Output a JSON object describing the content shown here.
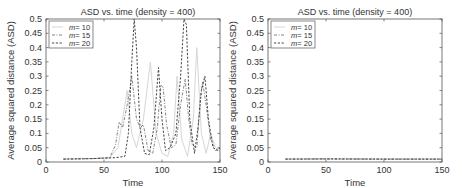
{
  "chart_data": [
    {
      "type": "line",
      "title": "ASD vs. time (density = 400)",
      "xlabel": "Time",
      "ylabel": "Average squared distance (ASD)",
      "xlim": [
        0,
        150
      ],
      "ylim": [
        0,
        0.5
      ],
      "xticks": [
        0,
        50,
        100,
        150
      ],
      "yticks": [
        0,
        0.05,
        0.1,
        0.15,
        0.2,
        0.25,
        0.3,
        0.35,
        0.4,
        0.45,
        0.5
      ],
      "grid": false,
      "legend_position": "upper left",
      "series": [
        {
          "name": "m = 10",
          "style": "solid-light-gray",
          "x": [
            15,
            40,
            55,
            62,
            66,
            70,
            74,
            78,
            84,
            90,
            95,
            100,
            105,
            110,
            113,
            117,
            122,
            127,
            130,
            134,
            138,
            142,
            146,
            150
          ],
          "y": [
            0.01,
            0.012,
            0.015,
            0.05,
            0.15,
            0.25,
            0.1,
            0.05,
            0.15,
            0.35,
            0.1,
            0.03,
            0.02,
            0.1,
            0.3,
            0.08,
            0.02,
            0.15,
            0.4,
            0.1,
            0.03,
            0.1,
            0.05,
            0.04
          ]
        },
        {
          "name": "m = 15",
          "style": "dash-dot-gray",
          "x": [
            15,
            40,
            55,
            60,
            63,
            66,
            70,
            74,
            78,
            81,
            84,
            88,
            92,
            96,
            99,
            101,
            104,
            108,
            112,
            116,
            120,
            123,
            126,
            130,
            133,
            135,
            138,
            142,
            146,
            150
          ],
          "y": [
            0.01,
            0.012,
            0.015,
            0.06,
            0.14,
            0.12,
            0.2,
            0.3,
            0.15,
            0.12,
            0.13,
            0.04,
            0.03,
            0.12,
            0.27,
            0.26,
            0.13,
            0.05,
            0.06,
            0.2,
            0.29,
            0.15,
            0.06,
            0.05,
            0.22,
            0.28,
            0.2,
            0.08,
            0.04,
            0.05
          ]
        },
        {
          "name": "m = 20",
          "style": "dashed-dark",
          "x": [
            15,
            40,
            60,
            68,
            71,
            74,
            76,
            78,
            81,
            85,
            89,
            93,
            97,
            100,
            103,
            107,
            112,
            116,
            119,
            121,
            124,
            128,
            131,
            134,
            137,
            140,
            144,
            148,
            150
          ],
          "y": [
            0.01,
            0.012,
            0.015,
            0.02,
            0.1,
            0.35,
            0.5,
            0.4,
            0.12,
            0.03,
            0.025,
            0.12,
            0.33,
            0.15,
            0.04,
            0.05,
            0.1,
            0.3,
            0.5,
            0.48,
            0.15,
            0.03,
            0.12,
            0.25,
            0.3,
            0.15,
            0.05,
            0.04,
            0.05
          ]
        }
      ]
    },
    {
      "type": "line",
      "title": "ASD vs. time (density = 400)",
      "xlabel": "Time",
      "ylabel": "Average squared distance (ASD)",
      "xlim": [
        0,
        150
      ],
      "ylim": [
        0,
        0.5
      ],
      "xticks": [
        0,
        50,
        100,
        150
      ],
      "yticks": [
        0,
        0.05,
        0.1,
        0.15,
        0.2,
        0.25,
        0.3,
        0.35,
        0.4,
        0.45,
        0.5
      ],
      "grid": false,
      "legend_position": "upper left",
      "series": [
        {
          "name": "m = 10",
          "style": "solid-light-gray",
          "x": [
            15,
            50,
            100,
            150
          ],
          "y": [
            0.01,
            0.01,
            0.01,
            0.01
          ]
        },
        {
          "name": "m = 15",
          "style": "dash-dot-gray",
          "x": [
            15,
            50,
            100,
            150
          ],
          "y": [
            0.01,
            0.011,
            0.01,
            0.01
          ]
        },
        {
          "name": "m = 20",
          "style": "dashed-dark",
          "x": [
            15,
            50,
            100,
            150
          ],
          "y": [
            0.01,
            0.011,
            0.01,
            0.01
          ]
        }
      ]
    }
  ],
  "labels": {
    "ytick_labels": [
      "0",
      "0.05",
      "0.1",
      "0.15",
      "0.2",
      "0.25",
      "0.3",
      "0.35",
      "0.4",
      "0.45",
      "0.5"
    ],
    "xtick_labels": [
      "0",
      "50",
      "100",
      "150"
    ],
    "legend_prefix": "m",
    "legend_values": [
      "= 10",
      "= 15",
      "= 20"
    ]
  }
}
